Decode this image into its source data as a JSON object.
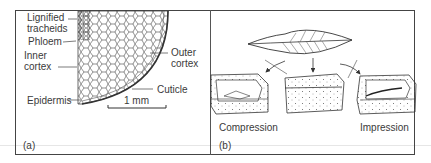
{
  "figure": {
    "panels": [
      {
        "id": "a",
        "tag": "(a)",
        "description": "Cross-section of a stem showing tissue layers",
        "labels": {
          "lignified": "Lignified",
          "tracheids": "tracheids",
          "phloem": "Phloem",
          "inner1": "Inner",
          "inner2": "cortex",
          "outer1": "Outer",
          "outer2": "cortex",
          "cuticle": "Cuticle",
          "epidermis": "Epidermis",
          "scale": "1 mm"
        }
      },
      {
        "id": "b",
        "tag": "(b)",
        "description": "Leaf buried in sediment splits into compression and impression fossils",
        "labels": {
          "compression": "Compression",
          "impression": "Impression"
        }
      }
    ],
    "colors": {
      "ink": "#333333",
      "border": "#444444",
      "background": "#ffffff"
    }
  }
}
